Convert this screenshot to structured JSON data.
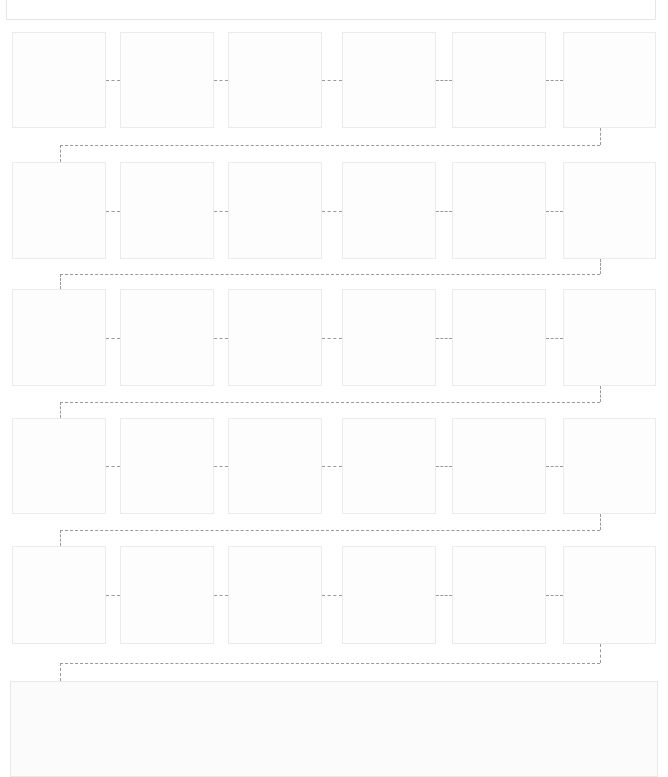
{
  "diagram": {
    "type": "flow",
    "header_box": {
      "text": ""
    },
    "rows": [
      {
        "steps": [
          "",
          "",
          "",
          "",
          "",
          ""
        ]
      },
      {
        "steps": [
          "",
          "",
          "",
          "",
          "",
          ""
        ]
      },
      {
        "steps": [
          "",
          "",
          "",
          "",
          "",
          ""
        ]
      },
      {
        "steps": [
          "",
          "",
          "",
          "",
          "",
          ""
        ]
      },
      {
        "steps": [
          "",
          "",
          "",
          "",
          "",
          ""
        ]
      }
    ],
    "final_box": {
      "text": ""
    },
    "colors": {
      "connector": "#9a9a9a",
      "box_border": "#ebebeb"
    }
  }
}
